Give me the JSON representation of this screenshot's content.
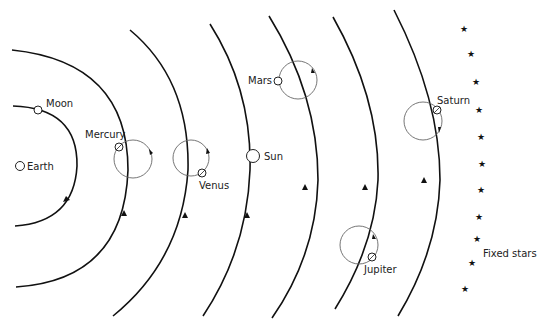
{
  "diagram": {
    "labels": {
      "earth": "Earth",
      "moon": "Moon",
      "mercury": "Mercury",
      "venus": "Venus",
      "sun": "Sun",
      "mars": "Mars",
      "jupiter": "Jupiter",
      "saturn": "Saturn",
      "fixed_stars": "Fixed stars"
    },
    "star_glyph": "★",
    "colors": {
      "orbit": "#111111",
      "epicycle": "#666666",
      "text": "#222222",
      "background": "#ffffff"
    }
  }
}
